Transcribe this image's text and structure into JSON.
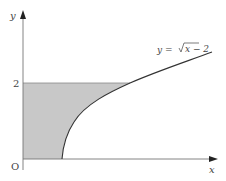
{
  "diagram": {
    "axes": {
      "x_label": "x",
      "y_label": "y",
      "origin_label": "O",
      "y_tick_label": "2"
    },
    "curve": {
      "equation_label_prefix": "y = ",
      "equation_label_radicand": "x − 2",
      "equation": "y = √(x − 2)"
    },
    "shaded_region": {
      "description": "Region bounded by y-axis, x-axis, line y = 2 and curve y = √(x − 2)",
      "fill_color": "#c8c8c8"
    },
    "colors": {
      "axis": "#777777",
      "curve": "#333333",
      "shade": "#c8c8c8",
      "text": "#444444"
    }
  }
}
